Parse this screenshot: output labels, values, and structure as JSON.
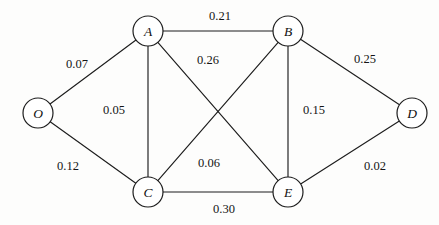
{
  "diagram": {
    "nodes": [
      {
        "id": "O",
        "label": "O",
        "x": 38,
        "y": 113,
        "r": 15
      },
      {
        "id": "A",
        "label": "A",
        "x": 148,
        "y": 31,
        "r": 15
      },
      {
        "id": "B",
        "label": "B",
        "x": 288,
        "y": 31,
        "r": 15
      },
      {
        "id": "C",
        "label": "C",
        "x": 148,
        "y": 192,
        "r": 15
      },
      {
        "id": "D",
        "label": "D",
        "x": 412,
        "y": 113,
        "r": 15
      },
      {
        "id": "E",
        "label": "E",
        "x": 288,
        "y": 192,
        "r": 15
      }
    ],
    "edges": [
      {
        "from": "O",
        "to": "A",
        "weight": "0.07",
        "label_x": 77,
        "label_y": 64
      },
      {
        "from": "O",
        "to": "C",
        "weight": "0.12",
        "label_x": 68,
        "label_y": 166
      },
      {
        "from": "A",
        "to": "B",
        "weight": "0.21",
        "label_x": 220,
        "label_y": 16
      },
      {
        "from": "A",
        "to": "C",
        "weight": "0.05",
        "label_x": 114,
        "label_y": 110
      },
      {
        "from": "A",
        "to": "E",
        "weight": "0.26",
        "label_x": 208,
        "label_y": 60
      },
      {
        "from": "B",
        "to": "C",
        "weight": "0.06",
        "label_x": 209,
        "label_y": 163
      },
      {
        "from": "B",
        "to": "D",
        "weight": "0.25",
        "label_x": 365,
        "label_y": 59
      },
      {
        "from": "B",
        "to": "E",
        "weight": "0.15",
        "label_x": 314,
        "label_y": 110
      },
      {
        "from": "C",
        "to": "E",
        "weight": "0.30",
        "label_x": 224,
        "label_y": 209
      },
      {
        "from": "D",
        "to": "E",
        "weight": "0.02",
        "label_x": 375,
        "label_y": 166
      }
    ],
    "colors": {
      "node_stroke": "#1d1d1d",
      "node_fill": "#ffffff",
      "edge_stroke": "#1d1d1d",
      "label_text": "#141414",
      "background": "#fdfdfc"
    }
  }
}
